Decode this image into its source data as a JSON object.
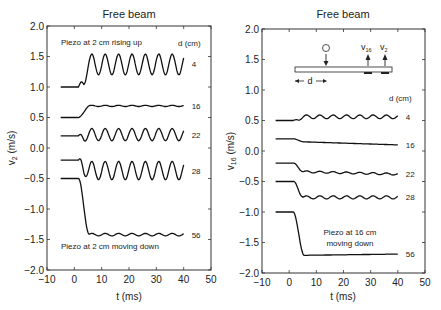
{
  "chart_data": [
    {
      "type": "line",
      "title": "Free beam",
      "xlabel": "t (ms)",
      "ylabel": "v2 (m/s)",
      "ylabel_main": "v",
      "ylabel_sub": "2",
      "ylabel_unit": " (m/s)",
      "xlim": [
        -10,
        50
      ],
      "ylim": [
        -2.0,
        2.0
      ],
      "xticks": [
        -10,
        0,
        10,
        20,
        30,
        40,
        50
      ],
      "yticks": [
        2.0,
        1.5,
        1.0,
        0.5,
        0.0,
        -0.5,
        -1.0,
        -1.5,
        -2.0
      ],
      "ytick_labels": [
        "2.0",
        "1.5",
        "1.0",
        "0.5",
        "0.0",
        "−0.5",
        "−1.0",
        "−1.5",
        "−2.0"
      ],
      "xtick_labels": [
        "−10",
        "0",
        "10",
        "20",
        "30",
        "40",
        "50"
      ],
      "legend_title": "d (cm)",
      "annotations": [
        "Piezo at 2 cm rising up",
        "Piezo at 2 cm moving down"
      ],
      "series": [
        {
          "name": "4",
          "baseline": 1.0,
          "onset": 1.5,
          "settle": 1.37,
          "osc_amp": 0.17,
          "period": 4.9,
          "x_range": [
            -5,
            40
          ]
        },
        {
          "name": "16",
          "baseline": 0.5,
          "onset": 1.5,
          "settle": 0.69,
          "osc_amp": 0.01,
          "period": 4.9,
          "x_range": [
            -5,
            40
          ]
        },
        {
          "name": "22",
          "baseline": 0.2,
          "onset": 1.5,
          "settle": 0.22,
          "osc_amp": 0.1,
          "period": 4.9,
          "x_range": [
            -5,
            40
          ]
        },
        {
          "name": "28",
          "baseline": -0.2,
          "onset": 1.5,
          "settle": -0.37,
          "osc_amp": 0.15,
          "period": 4.9,
          "x_range": [
            -5,
            40
          ]
        },
        {
          "name": "56",
          "baseline": -0.5,
          "onset": 1.5,
          "settle": -1.42,
          "osc_amp": 0.02,
          "period": 4.9,
          "x_range": [
            -5,
            40
          ]
        }
      ]
    },
    {
      "type": "line",
      "title": "Free beam",
      "xlabel": "t (ms)",
      "ylabel": "v16 (m/s)",
      "ylabel_main": "v",
      "ylabel_sub": "16",
      "ylabel_unit": " (m/s)",
      "xlim": [
        -10,
        50
      ],
      "ylim": [
        -2.0,
        2.0
      ],
      "xticks": [
        -10,
        0,
        10,
        20,
        30,
        40,
        50
      ],
      "yticks": [
        2.0,
        1.5,
        1.0,
        0.5,
        0.0,
        -0.5,
        -1.0,
        -1.5,
        -2.0
      ],
      "ytick_labels": [
        "2.0",
        "1.5",
        "1.0",
        "0.5",
        "0.0",
        "−0.5",
        "−1.0",
        "−1.5",
        "−2.0"
      ],
      "xtick_labels": [
        "−10",
        "0",
        "10",
        "20",
        "30",
        "40",
        "50"
      ],
      "legend_title": "d (cm)",
      "annotations": [
        "Piezo at 16 cm",
        "moving down"
      ],
      "inset": {
        "d_label": "d",
        "v16_label": "v",
        "v16_sub": "16",
        "v2_label": "v",
        "v2_sub": "2"
      },
      "series": [
        {
          "name": "4",
          "baseline": 0.5,
          "onset": 1.5,
          "settle": 0.56,
          "osc_amp": 0.03,
          "period": 4.9,
          "x_range": [
            -5,
            40
          ]
        },
        {
          "name": "16",
          "baseline": 0.2,
          "onset": 1.5,
          "settle": 0.15,
          "drift_end": 0.1,
          "osc_amp": 0.0,
          "period": 4.9,
          "x_range": [
            -5,
            40
          ]
        },
        {
          "name": "22",
          "baseline": -0.2,
          "onset": 1.5,
          "settle": -0.34,
          "drift_end": -0.38,
          "osc_amp": 0.015,
          "period": 4.9,
          "x_range": [
            -5,
            40
          ]
        },
        {
          "name": "28",
          "baseline": -0.5,
          "onset": 1.5,
          "settle": -0.76,
          "osc_amp": 0.025,
          "period": 4.9,
          "x_range": [
            -5,
            40
          ]
        },
        {
          "name": "56",
          "baseline": -1.0,
          "onset": 1.5,
          "settle": -1.71,
          "drift_end": -1.69,
          "osc_amp": 0.0,
          "period": 4.9,
          "x_range": [
            -5,
            40
          ]
        }
      ]
    }
  ]
}
